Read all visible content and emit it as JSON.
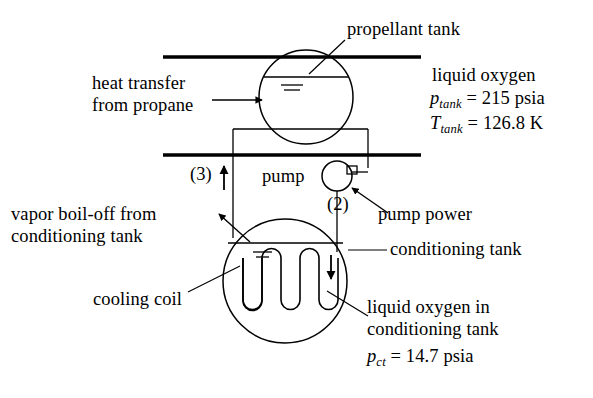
{
  "figure": {
    "background_color": "#ffffff",
    "line_color": "#000000"
  },
  "labels": {
    "propellant_tank": "propellant tank",
    "heat_transfer_line1": "heat transfer",
    "heat_transfer_line2": "from propane",
    "liquid_oxygen": "liquid oxygen",
    "pump": "pump",
    "pump_power": "pump power",
    "state_3": "(3)",
    "state_2": "(2)",
    "vapor_boiloff_line1": "vapor boil-off from",
    "vapor_boiloff_line2": "conditioning tank",
    "conditioning_tank": "conditioning tank",
    "cooling_coil": "cooling coil",
    "lox_in_ct_line1": "liquid oxygen in",
    "lox_in_ct_line2": "conditioning tank"
  },
  "equations": {
    "p_tank": {
      "symbol": "p",
      "subscript": "tank",
      "relation": "=",
      "value": "215",
      "unit": "psia"
    },
    "t_tank": {
      "symbol": "T",
      "subscript": "tank",
      "relation": "=",
      "value": "126.8",
      "unit": "K"
    },
    "p_ct": {
      "symbol": "p",
      "subscript": "ct",
      "relation": "=",
      "value": "14.7",
      "unit": "psia"
    }
  }
}
